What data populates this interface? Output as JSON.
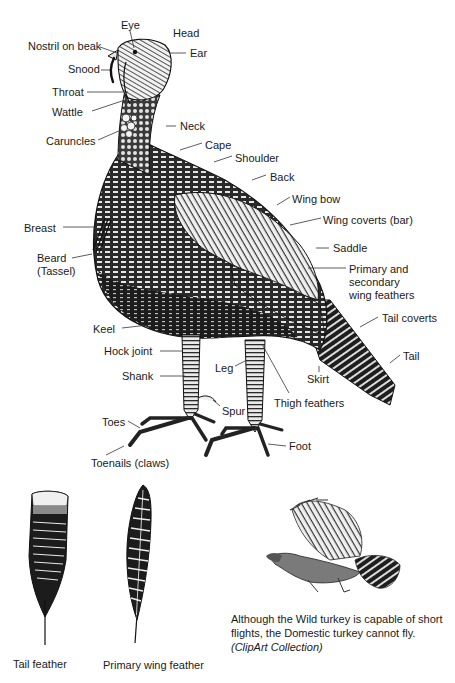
{
  "diagram": {
    "labels": [
      {
        "id": "eye",
        "text": "Eye",
        "x": 121,
        "y": 19
      },
      {
        "id": "head",
        "text": "Head",
        "x": 173,
        "y": 27
      },
      {
        "id": "nostril-on-beak",
        "text": "Nostril on beak",
        "x": 28,
        "y": 40
      },
      {
        "id": "ear",
        "text": "Ear",
        "x": 190,
        "y": 47
      },
      {
        "id": "snood",
        "text": "Snood",
        "x": 68,
        "y": 63
      },
      {
        "id": "throat",
        "text": "Throat",
        "x": 52,
        "y": 86
      },
      {
        "id": "wattle",
        "text": "Wattle",
        "x": 52,
        "y": 106
      },
      {
        "id": "neck",
        "text": "Neck",
        "x": 180,
        "y": 120
      },
      {
        "id": "caruncles",
        "text": "Caruncles",
        "x": 46,
        "y": 135
      },
      {
        "id": "cape",
        "text": "Cape",
        "x": 205,
        "y": 139
      },
      {
        "id": "shoulder",
        "text": "Shoulder",
        "x": 235,
        "y": 152
      },
      {
        "id": "back",
        "text": "Back",
        "x": 270,
        "y": 171
      },
      {
        "id": "wing-bow",
        "text": "Wing bow",
        "x": 292,
        "y": 193
      },
      {
        "id": "wing-coverts",
        "text": "Wing coverts (bar)",
        "x": 323,
        "y": 214
      },
      {
        "id": "breast",
        "text": "Breast",
        "x": 24,
        "y": 222
      },
      {
        "id": "saddle",
        "text": "Saddle",
        "x": 333,
        "y": 242
      },
      {
        "id": "beard",
        "text": "Beard\n(Tassel)",
        "x": 37,
        "y": 252
      },
      {
        "id": "primary-secondary",
        "text": "Primary and secondary\nwing feathers",
        "x": 349,
        "y": 263
      },
      {
        "id": "tail-coverts",
        "text": "Tail coverts",
        "x": 382,
        "y": 312
      },
      {
        "id": "keel",
        "text": "Keel",
        "x": 93,
        "y": 323
      },
      {
        "id": "hock-joint",
        "text": "Hock joint",
        "x": 104,
        "y": 345
      },
      {
        "id": "leg",
        "text": "Leg",
        "x": 215,
        "y": 362
      },
      {
        "id": "tail",
        "text": "Tail",
        "x": 403,
        "y": 350
      },
      {
        "id": "shank",
        "text": "Shank",
        "x": 122,
        "y": 370
      },
      {
        "id": "skirt",
        "text": "Skirt",
        "x": 307,
        "y": 373
      },
      {
        "id": "thigh-feathers",
        "text": "Thigh feathers",
        "x": 274,
        "y": 397
      },
      {
        "id": "spur",
        "text": "Spur",
        "x": 222,
        "y": 405
      },
      {
        "id": "toes",
        "text": "Toes",
        "x": 102,
        "y": 416
      },
      {
        "id": "foot",
        "text": "Foot",
        "x": 289,
        "y": 440
      },
      {
        "id": "toenails",
        "text": "Toenails (claws)",
        "x": 91,
        "y": 457
      }
    ]
  },
  "feathers": {
    "tail_feather_label": "Tail feather",
    "primary_wing_feather_label": "Primary wing feather"
  },
  "caption": {
    "line1": "Although the Wild turkey is capable of short",
    "line2": "flights, the Domestic turkey cannot fly.",
    "source": "(ClipArt Collection)"
  },
  "colors": {
    "ink": "#1a1a1a",
    "background": "#ffffff",
    "feather_light": "#e8e8e8"
  }
}
